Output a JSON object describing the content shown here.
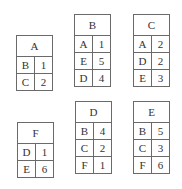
{
  "tables": [
    {
      "node": "A",
      "position": {
        "left": 16,
        "top": 35
      },
      "edges": [
        {
          "neighbor": "B",
          "weight": "1"
        },
        {
          "neighbor": "C",
          "weight": "2"
        }
      ]
    },
    {
      "node": "B",
      "position": {
        "left": 74,
        "top": 14
      },
      "edges": [
        {
          "neighbor": "A",
          "weight": "1"
        },
        {
          "neighbor": "E",
          "weight": "5"
        },
        {
          "neighbor": "D",
          "weight": "4"
        }
      ]
    },
    {
      "node": "C",
      "position": {
        "left": 133,
        "top": 14
      },
      "edges": [
        {
          "neighbor": "A",
          "weight": "2"
        },
        {
          "neighbor": "D",
          "weight": "2"
        },
        {
          "neighbor": "E",
          "weight": "3"
        }
      ]
    },
    {
      "node": "F",
      "position": {
        "left": 17,
        "top": 122
      },
      "edges": [
        {
          "neighbor": "D",
          "weight": "1"
        },
        {
          "neighbor": "E",
          "weight": "6"
        }
      ]
    },
    {
      "node": "D",
      "position": {
        "left": 75,
        "top": 101
      },
      "edges": [
        {
          "neighbor": "B",
          "weight": "4"
        },
        {
          "neighbor": "C",
          "weight": "2"
        },
        {
          "neighbor": "F",
          "weight": "1"
        }
      ]
    },
    {
      "node": "E",
      "position": {
        "left": 133,
        "top": 101
      },
      "edges": [
        {
          "neighbor": "B",
          "weight": "5"
        },
        {
          "neighbor": "C",
          "weight": "3"
        },
        {
          "neighbor": "F",
          "weight": "6"
        }
      ]
    }
  ]
}
